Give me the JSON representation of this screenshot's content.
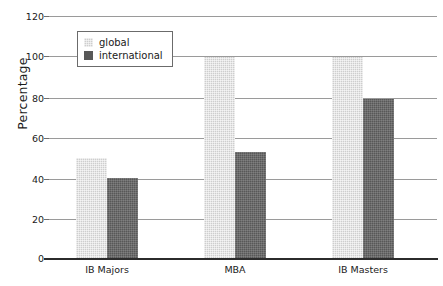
{
  "chart_data": {
    "type": "bar",
    "title": "",
    "subtitle": "",
    "xlabel": "",
    "ylabel": "Percentage",
    "categories": [
      "IB Majors",
      "MBA",
      "IB Masters"
    ],
    "series": [
      {
        "name": "global",
        "values": [
          50,
          100,
          100
        ],
        "color": "#cecece"
      },
      {
        "name": "international",
        "values": [
          40,
          53,
          79
        ],
        "color": "#585858"
      }
    ],
    "ylim": [
      0,
      120
    ],
    "yticks": [
      0,
      20,
      40,
      60,
      80,
      100,
      120
    ],
    "ytick_labels": [
      "0",
      "20",
      "40",
      "60",
      "80",
      "100",
      "120"
    ],
    "grid": true,
    "grid_axis": "y",
    "legend_position": "upper-left-inside",
    "legend_entries": [
      "global",
      "international"
    ],
    "annotations": []
  },
  "axis": {
    "y_title": "Percentage",
    "tick_0": "0",
    "tick_20": "20",
    "tick_40": "40",
    "tick_60": "60",
    "tick_80": "80",
    "tick_100": "100",
    "tick_120": "120"
  },
  "legend": {
    "global_label": "global",
    "international_label": "international"
  },
  "xlabels": {
    "cat0": "IB Majors",
    "cat1": "MBA",
    "cat2": "IB Masters"
  }
}
